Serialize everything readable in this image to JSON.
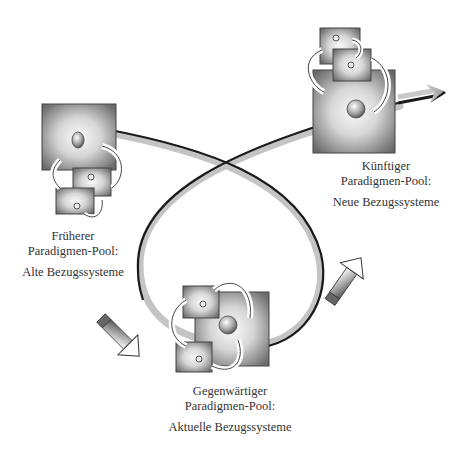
{
  "diagram": {
    "type": "paradigm-cycle",
    "colors": {
      "ribbon_dark": "#1a1a1a",
      "ribbon_light": "#bdbdbd",
      "box_edge": "#555555",
      "box_center": "#f4f4f4",
      "text": "#333333"
    },
    "nodes": [
      {
        "id": "frueher",
        "title": "Früherer",
        "subtitle": "Paradigmen-Pool:",
        "description": "Alte Bezugssysteme"
      },
      {
        "id": "gegenwaertig",
        "title": "Gegenwärtiger",
        "subtitle": "Paradigmen-Pool:",
        "description": "Aktuelle Bezugssysteme"
      },
      {
        "id": "kuenftig",
        "title": "Künftiger",
        "subtitle": "Paradigmen-Pool:",
        "description": "Neue Bezugssysteme"
      }
    ],
    "edges": [
      {
        "from": "frueher",
        "to": "gegenwaertig",
        "style": "pencil-arrow"
      },
      {
        "from": "gegenwaertig",
        "to": "kuenftig",
        "style": "pencil-arrow"
      },
      {
        "from": "frueher",
        "to": "kuenftig",
        "style": "looping-ribbon-arrow"
      }
    ]
  }
}
